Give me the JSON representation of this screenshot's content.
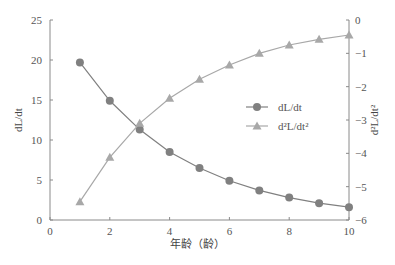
{
  "chart_data": {
    "type": "line",
    "title": "",
    "x": [
      1,
      2,
      3,
      4,
      5,
      6,
      7,
      8,
      9,
      10
    ],
    "xlabel": "年龄（龄）",
    "xlim": [
      0,
      10
    ],
    "xticks": [
      0,
      2,
      4,
      6,
      8,
      10
    ],
    "ylabel_left": "dL/dt",
    "ylim_left": [
      0,
      25
    ],
    "yticks_left": [
      0,
      5,
      10,
      15,
      20,
      25
    ],
    "ylabel_right": "d²L/dt²",
    "ylim_right": [
      -6,
      0
    ],
    "yticks_right": [
      0,
      -1,
      -2,
      -3,
      -4,
      -5,
      -6
    ],
    "grid": false,
    "legend_position": "center-right",
    "series": [
      {
        "name": "dL/dt",
        "axis": "left",
        "marker": "circle",
        "color": "#808080",
        "values": [
          19.7,
          14.9,
          11.3,
          8.5,
          6.5,
          4.9,
          3.7,
          2.8,
          2.1,
          1.6
        ]
      },
      {
        "name": "d²L/dt²",
        "axis": "right",
        "marker": "triangle",
        "color": "#a8a8a8",
        "values": [
          -5.45,
          -4.12,
          -3.1,
          -2.35,
          -1.78,
          -1.35,
          -1.0,
          -0.75,
          -0.58,
          -0.45
        ]
      }
    ]
  },
  "labels": {
    "xlabel": "年龄（龄）",
    "ylabel_left": "dL/dt",
    "ylabel_right": "d²L/dt²",
    "legend_1": "dL/dt",
    "legend_2": "d²L/dt²"
  }
}
